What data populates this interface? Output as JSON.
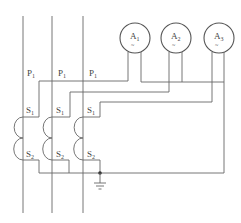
{
  "diagram": {
    "type": "current-transformer-ammeter-wiring",
    "meters": [
      {
        "label": "A",
        "sub": "1",
        "symbol": "~"
      },
      {
        "label": "A",
        "sub": "2",
        "symbol": "~"
      },
      {
        "label": "A",
        "sub": "3",
        "symbol": "~"
      }
    ],
    "phases": [
      {
        "primary_label": "P",
        "primary_sub": "1",
        "s1_label": "S",
        "s1_sub": "1",
        "s2_label": "S",
        "s2_sub": "2"
      },
      {
        "primary_label": "P",
        "primary_sub": "1",
        "s1_label": "S",
        "s1_sub": "1",
        "s2_label": "S",
        "s2_sub": "2"
      },
      {
        "primary_label": "P",
        "primary_sub": "1",
        "s1_label": "S",
        "s1_sub": "1",
        "s2_label": "S",
        "s2_sub": "2"
      }
    ],
    "ground": "ground-symbol",
    "colors": {
      "line": "#666666",
      "text": "#444444",
      "background": "#ffffff"
    }
  }
}
